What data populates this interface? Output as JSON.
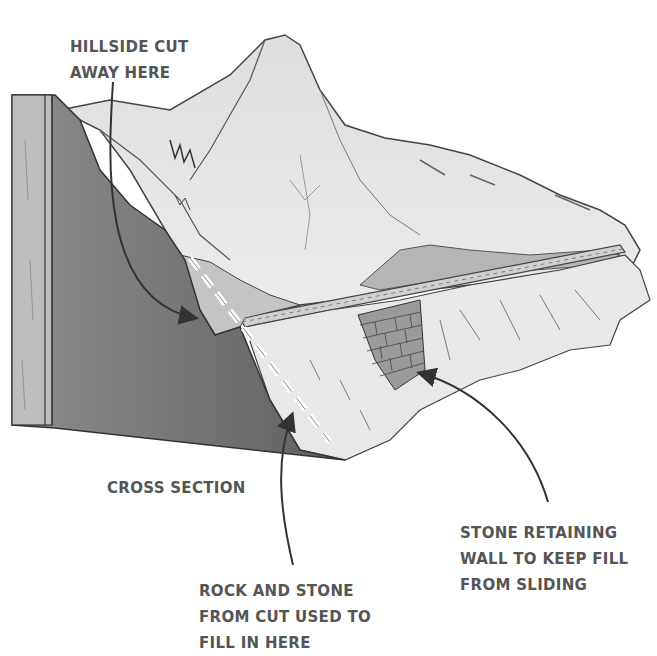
{
  "diagram": {
    "labels": {
      "hillside_cut": {
        "lines": [
          "HILLSIDE CUT",
          "AWAY HERE"
        ]
      },
      "cross_section": {
        "lines": [
          "CROSS SECTION"
        ]
      },
      "rock_fill": {
        "lines": [
          "ROCK AND STONE",
          "FROM CUT USED TO",
          "FILL IN HERE"
        ]
      },
      "retaining_wall": {
        "lines": [
          "STONE RETAINING",
          "WALL TO KEEP FILL",
          "FROM SLIDING"
        ]
      }
    },
    "colors": {
      "label_text": "#555555",
      "section_dark": "#6e6e6e",
      "section_mid": "#8a8a8a",
      "mountain_light": "#e6e6e6",
      "outline": "#3a3a3a",
      "cut_line": "#ffffff"
    }
  }
}
